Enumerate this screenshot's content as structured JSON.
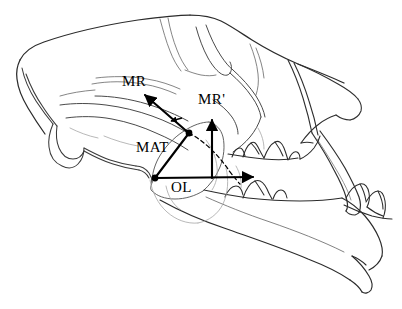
{
  "figure": {
    "background_color": "#ffffff",
    "ink_color": "#000000",
    "faint_ink_color": "#8a8a8a",
    "width": 402,
    "height": 309
  },
  "labels": {
    "mr": "MR",
    "mr_prime": "MR'",
    "mat": "MAT",
    "ol": "OL"
  },
  "annotations": {
    "vectors": [
      {
        "name": "MR",
        "label": "MR",
        "description": "arrow from muscle insertion vertex up and to the left",
        "from": [
          189,
          133
        ],
        "to": [
          143,
          93
        ],
        "style": "solid",
        "arrowhead": "end"
      },
      {
        "name": "MR'",
        "label": "MR'",
        "description": "vertical arrow from occlusal line up to muscle resultant height",
        "from": [
          212,
          177
        ],
        "to": [
          212,
          118
        ],
        "style": "solid",
        "arrowhead": "end"
      },
      {
        "name": "MAT",
        "label": "MAT",
        "description": "solid line from jaw joint up to muscle insertion vertex",
        "from": [
          155,
          178
        ],
        "to": [
          189,
          133
        ],
        "style": "solid",
        "arrowhead": "none"
      },
      {
        "name": "OL",
        "label": "OL",
        "description": "horizontal out-lever arrow from jaw joint to bite point at carnassial",
        "from": [
          155,
          178
        ],
        "to": [
          255,
          177
        ],
        "style": "solid",
        "arrowhead": "end"
      },
      {
        "name": "moment-arc",
        "label": "",
        "description": "dashed arc from muscle insertion vertex sweeping down and right to the occlusal line, with small arrowhead indicating rotation",
        "from": [
          189,
          133
        ],
        "to": [
          240,
          183
        ],
        "style": "dashed",
        "arrowhead": "small-left"
      }
    ],
    "vertices": [
      {
        "name": "muscle-insertion-point",
        "at": [
          189,
          133
        ]
      },
      {
        "name": "jaw-joint-point",
        "at": [
          155,
          178
        ]
      }
    ]
  },
  "legend_note": ""
}
